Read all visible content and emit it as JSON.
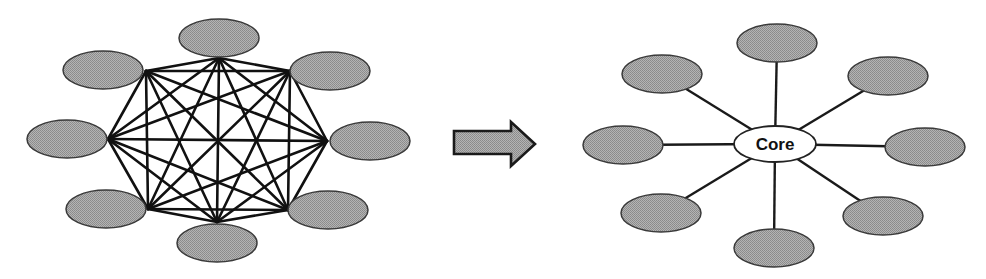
{
  "figure": {
    "colors": {
      "node_fill": "#a3a3a3",
      "node_stroke": "#3a3a3a",
      "edge": "#111111",
      "core_fill": "#ffffff",
      "background": "#ffffff"
    }
  },
  "mesh": {
    "label": "full-mesh",
    "node_count": 8,
    "nodes": [
      {
        "id": "top",
        "cx": 219,
        "cy": 38,
        "vx": 219,
        "vy": 58
      },
      {
        "id": "top-right",
        "cx": 330,
        "cy": 71,
        "vx": 290,
        "vy": 71
      },
      {
        "id": "right",
        "cx": 370,
        "cy": 141,
        "vx": 327,
        "vy": 141
      },
      {
        "id": "bottom-right",
        "cx": 328,
        "cy": 210,
        "vx": 288,
        "vy": 210
      },
      {
        "id": "bottom",
        "cx": 217,
        "cy": 243,
        "vx": 217,
        "vy": 222
      },
      {
        "id": "bottom-left",
        "cx": 106,
        "cy": 209,
        "vx": 148,
        "vy": 209
      },
      {
        "id": "left",
        "cx": 67,
        "cy": 139,
        "vx": 108,
        "vy": 139
      },
      {
        "id": "top-left",
        "cx": 103,
        "cy": 70,
        "vx": 146,
        "vy": 71
      }
    ]
  },
  "transition_arrow": {
    "direction": "right"
  },
  "hub": {
    "core_label": "Core",
    "core": {
      "cx": 775,
      "cy": 144,
      "rx": 41,
      "ry": 18
    },
    "nodes": [
      {
        "id": "top",
        "cx": 777,
        "cy": 43
      },
      {
        "id": "top-right",
        "cx": 888,
        "cy": 76
      },
      {
        "id": "right",
        "cx": 925,
        "cy": 147
      },
      {
        "id": "bottom-right",
        "cx": 883,
        "cy": 216
      },
      {
        "id": "bottom",
        "cx": 774,
        "cy": 248
      },
      {
        "id": "bottom-left",
        "cx": 661,
        "cy": 213
      },
      {
        "id": "left",
        "cx": 623,
        "cy": 145
      },
      {
        "id": "top-left",
        "cx": 662,
        "cy": 74
      }
    ]
  }
}
